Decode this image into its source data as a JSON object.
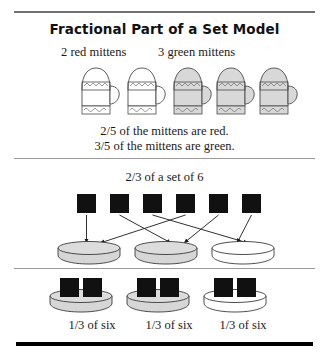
{
  "title": "Fractional Part of a Set Model",
  "sections": {
    "mittens": {
      "label_red": "2 red mittens",
      "label_green": "3 green mittens",
      "sentence_red": "2/5 of the mittens are red.",
      "sentence_green": "3/5 of the mittens are green.",
      "items": [
        {
          "index": 1,
          "group": "red",
          "fill": "#ffffff"
        },
        {
          "index": 2,
          "group": "red",
          "fill": "#ffffff"
        },
        {
          "index": 3,
          "group": "green",
          "fill": "#d8d8d8"
        },
        {
          "index": 4,
          "group": "green",
          "fill": "#d8d8d8"
        },
        {
          "index": 5,
          "group": "green",
          "fill": "#d8d8d8"
        }
      ],
      "counts": {
        "red": 2,
        "green": 3,
        "total": 5
      }
    },
    "set_of_six": {
      "heading": "2/3 of a set of 6",
      "square_count": 6,
      "dish_count": 3,
      "dishes_filled": [
        true,
        true,
        false
      ],
      "mapping": [
        1,
        2,
        3,
        1,
        2,
        3
      ]
    },
    "thirds": {
      "captions": [
        "1/3 of six",
        "1/3 of six",
        "1/3 of six"
      ],
      "squares_per_dish": 2,
      "dishes_filled": [
        true,
        true,
        false
      ]
    }
  },
  "colors": {
    "square_fill": "#111111",
    "dish_fill": "#d6d6d6",
    "dish_empty": "#ffffff",
    "outline": "#3a3a3a",
    "rule_gray": "#9a9a9a",
    "rule_dark": "#707070",
    "rule_black": "#000000",
    "text": "#1a1a1a"
  }
}
